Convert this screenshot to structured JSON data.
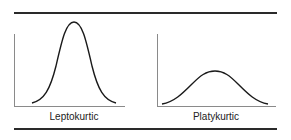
{
  "figure": {
    "panels": [
      {
        "id": "leptokurtic",
        "label": "Leptokurtic",
        "shape": "tall narrow peak"
      },
      {
        "id": "platykurtic",
        "label": "Platykurtic",
        "shape": "low broad peak"
      }
    ],
    "colors": {
      "line": "#1a1a1a",
      "axis": "#8a8a8a",
      "rule": "#2a2a2a"
    }
  }
}
